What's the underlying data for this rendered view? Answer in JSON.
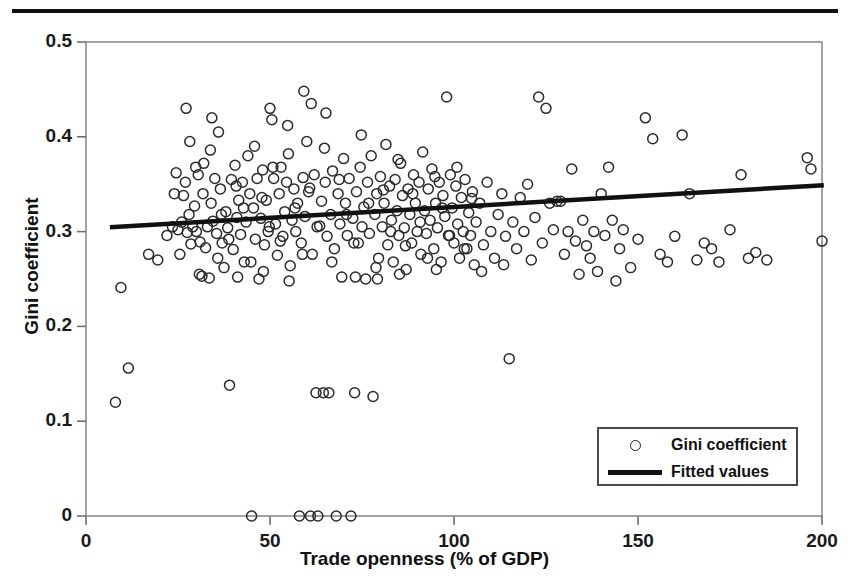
{
  "figure": {
    "has_top_rule": true,
    "background_color": "#ffffff",
    "ink_color": "#111111",
    "axis_color": "#808080"
  },
  "legend": {
    "position": "bottom-right",
    "entries": [
      {
        "label": "Gini coefficient",
        "marker": "open-circle"
      },
      {
        "label": "Fitted values",
        "marker": "solid-line"
      }
    ]
  },
  "chart_data": {
    "type": "scatter",
    "title": "",
    "xlabel": "Trade openness (% of GDP)",
    "ylabel": "Gini coefficient",
    "xlim": [
      0,
      200
    ],
    "ylim": [
      0,
      0.5
    ],
    "xticks": [
      0,
      50,
      100,
      150,
      200
    ],
    "xtick_labels": [
      "0",
      "50",
      "100",
      "150",
      "200"
    ],
    "yticks": [
      0,
      0.1,
      0.2,
      0.3,
      0.4,
      0.5
    ],
    "ytick_labels": [
      "0",
      "0.1",
      "0.2",
      "0.3",
      "0.4",
      "0.5"
    ],
    "grid": false,
    "legend_position": "lower right",
    "series": [
      {
        "name": "Gini coefficient",
        "marker": "open-circle",
        "marker_size": 10,
        "points": [
          [
            9.5,
            0.241
          ],
          [
            8.0,
            0.12
          ],
          [
            11.5,
            0.156
          ],
          [
            39.0,
            0.138
          ],
          [
            17.0,
            0.276
          ],
          [
            19.5,
            0.27
          ],
          [
            22.0,
            0.296
          ],
          [
            23.5,
            0.305
          ],
          [
            25.0,
            0.302
          ],
          [
            26.0,
            0.31
          ],
          [
            26.5,
            0.338
          ],
          [
            27.0,
            0.352
          ],
          [
            27.5,
            0.299
          ],
          [
            28.0,
            0.318
          ],
          [
            28.5,
            0.287
          ],
          [
            29.0,
            0.305
          ],
          [
            29.5,
            0.327
          ],
          [
            30.0,
            0.3
          ],
          [
            30.5,
            0.36
          ],
          [
            31.0,
            0.289
          ],
          [
            31.5,
            0.253
          ],
          [
            32.0,
            0.372
          ],
          [
            32.5,
            0.283
          ],
          [
            33.0,
            0.305
          ],
          [
            33.5,
            0.251
          ],
          [
            34.0,
            0.33
          ],
          [
            34.5,
            0.311
          ],
          [
            35.0,
            0.356
          ],
          [
            35.5,
            0.298
          ],
          [
            36.0,
            0.405
          ],
          [
            36.5,
            0.345
          ],
          [
            37.0,
            0.288
          ],
          [
            37.5,
            0.262
          ],
          [
            38.0,
            0.321
          ],
          [
            38.5,
            0.304
          ],
          [
            39.5,
            0.355
          ],
          [
            40.0,
            0.281
          ],
          [
            40.5,
            0.37
          ],
          [
            41.0,
            0.315
          ],
          [
            41.5,
            0.333
          ],
          [
            42.0,
            0.297
          ],
          [
            42.5,
            0.352
          ],
          [
            43.0,
            0.268
          ],
          [
            43.5,
            0.31
          ],
          [
            44.0,
            0.38
          ],
          [
            44.5,
            0.34
          ],
          [
            45.0,
            0.0
          ],
          [
            45.5,
            0.325
          ],
          [
            46.0,
            0.292
          ],
          [
            46.5,
            0.356
          ],
          [
            47.0,
            0.25
          ],
          [
            47.5,
            0.314
          ],
          [
            48.0,
            0.365
          ],
          [
            48.5,
            0.286
          ],
          [
            49.0,
            0.333
          ],
          [
            49.5,
            0.3
          ],
          [
            50.0,
            0.43
          ],
          [
            50.5,
            0.418
          ],
          [
            51.0,
            0.356
          ],
          [
            51.5,
            0.308
          ],
          [
            52.0,
            0.275
          ],
          [
            52.5,
            0.34
          ],
          [
            53.0,
            0.368
          ],
          [
            53.5,
            0.295
          ],
          [
            54.0,
            0.321
          ],
          [
            54.5,
            0.352
          ],
          [
            55.0,
            0.382
          ],
          [
            55.5,
            0.264
          ],
          [
            56.0,
            0.312
          ],
          [
            56.5,
            0.345
          ],
          [
            57.0,
            0.3
          ],
          [
            57.5,
            0.33
          ],
          [
            58.0,
            0.0
          ],
          [
            58.5,
            0.288
          ],
          [
            59.0,
            0.357
          ],
          [
            59.5,
            0.316
          ],
          [
            60.0,
            0.395
          ],
          [
            60.5,
            0.342
          ],
          [
            61.0,
            0.0
          ],
          [
            61.5,
            0.276
          ],
          [
            62.0,
            0.36
          ],
          [
            62.5,
            0.13
          ],
          [
            63.0,
            0.0
          ],
          [
            63.5,
            0.306
          ],
          [
            64.0,
            0.332
          ],
          [
            64.5,
            0.13
          ],
          [
            65.0,
            0.352
          ],
          [
            65.5,
            0.295
          ],
          [
            66.0,
            0.13
          ],
          [
            66.5,
            0.318
          ],
          [
            67.0,
            0.364
          ],
          [
            67.5,
            0.282
          ],
          [
            68.0,
            0.0
          ],
          [
            68.5,
            0.34
          ],
          [
            69.0,
            0.308
          ],
          [
            69.5,
            0.252
          ],
          [
            70.0,
            0.377
          ],
          [
            70.5,
            0.33
          ],
          [
            71.0,
            0.296
          ],
          [
            71.5,
            0.356
          ],
          [
            72.0,
            0.0
          ],
          [
            72.5,
            0.314
          ],
          [
            73.0,
            0.13
          ],
          [
            73.5,
            0.342
          ],
          [
            74.0,
            0.288
          ],
          [
            74.5,
            0.368
          ],
          [
            75.0,
            0.305
          ],
          [
            75.5,
            0.326
          ],
          [
            76.0,
            0.25
          ],
          [
            76.5,
            0.352
          ],
          [
            77.0,
            0.298
          ],
          [
            77.5,
            0.38
          ],
          [
            78.0,
            0.126
          ],
          [
            78.5,
            0.318
          ],
          [
            79.0,
            0.34
          ],
          [
            79.5,
            0.272
          ],
          [
            80.0,
            0.358
          ],
          [
            80.5,
            0.305
          ],
          [
            81.0,
            0.33
          ],
          [
            81.5,
            0.392
          ],
          [
            82.0,
            0.286
          ],
          [
            82.5,
            0.348
          ],
          [
            83.0,
            0.312
          ],
          [
            83.5,
            0.268
          ],
          [
            84.0,
            0.355
          ],
          [
            84.5,
            0.322
          ],
          [
            85.0,
            0.296
          ],
          [
            85.5,
            0.372
          ],
          [
            86.0,
            0.338
          ],
          [
            86.5,
            0.304
          ],
          [
            87.0,
            0.26
          ],
          [
            87.5,
            0.345
          ],
          [
            88.0,
            0.318
          ],
          [
            88.5,
            0.288
          ],
          [
            89.0,
            0.36
          ],
          [
            89.5,
            0.33
          ],
          [
            90.0,
            0.3
          ],
          [
            90.5,
            0.352
          ],
          [
            91.0,
            0.276
          ],
          [
            91.5,
            0.384
          ],
          [
            92.0,
            0.322
          ],
          [
            92.5,
            0.298
          ],
          [
            93.0,
            0.345
          ],
          [
            93.5,
            0.312
          ],
          [
            94.0,
            0.366
          ],
          [
            94.5,
            0.282
          ],
          [
            95.0,
            0.33
          ],
          [
            95.5,
            0.304
          ],
          [
            96.0,
            0.352
          ],
          [
            96.5,
            0.268
          ],
          [
            97.0,
            0.338
          ],
          [
            97.5,
            0.316
          ],
          [
            98.0,
            0.442
          ],
          [
            98.5,
            0.296
          ],
          [
            99.0,
            0.36
          ],
          [
            99.5,
            0.325
          ],
          [
            100.0,
            0.288
          ],
          [
            100.5,
            0.348
          ],
          [
            101.0,
            0.308
          ],
          [
            101.5,
            0.272
          ],
          [
            102.0,
            0.336
          ],
          [
            102.5,
            0.3
          ],
          [
            103.0,
            0.355
          ],
          [
            103.5,
            0.282
          ],
          [
            104.0,
            0.32
          ],
          [
            104.5,
            0.296
          ],
          [
            105.0,
            0.342
          ],
          [
            105.5,
            0.265
          ],
          [
            106.0,
            0.31
          ],
          [
            107.0,
            0.33
          ],
          [
            108.0,
            0.286
          ],
          [
            109.0,
            0.352
          ],
          [
            110.0,
            0.3
          ],
          [
            111.0,
            0.272
          ],
          [
            112.0,
            0.318
          ],
          [
            113.0,
            0.34
          ],
          [
            114.0,
            0.295
          ],
          [
            115.0,
            0.166
          ],
          [
            116.0,
            0.31
          ],
          [
            117.0,
            0.282
          ],
          [
            118.0,
            0.336
          ],
          [
            119.0,
            0.3
          ],
          [
            120.0,
            0.35
          ],
          [
            121.0,
            0.27
          ],
          [
            122.0,
            0.315
          ],
          [
            123.0,
            0.442
          ],
          [
            124.0,
            0.288
          ],
          [
            125.0,
            0.43
          ],
          [
            126.0,
            0.33
          ],
          [
            127.0,
            0.302
          ],
          [
            128.0,
            0.332
          ],
          [
            129.0,
            0.332
          ],
          [
            130.0,
            0.276
          ],
          [
            131.0,
            0.3
          ],
          [
            132.0,
            0.366
          ],
          [
            133.0,
            0.29
          ],
          [
            134.0,
            0.255
          ],
          [
            135.0,
            0.312
          ],
          [
            136.0,
            0.285
          ],
          [
            137.0,
            0.272
          ],
          [
            138.0,
            0.3
          ],
          [
            139.0,
            0.258
          ],
          [
            140.0,
            0.34
          ],
          [
            141.0,
            0.296
          ],
          [
            142.0,
            0.368
          ],
          [
            143.0,
            0.312
          ],
          [
            144.0,
            0.248
          ],
          [
            145.0,
            0.282
          ],
          [
            146.0,
            0.302
          ],
          [
            148.0,
            0.262
          ],
          [
            150.0,
            0.292
          ],
          [
            152.0,
            0.42
          ],
          [
            154.0,
            0.398
          ],
          [
            156.0,
            0.276
          ],
          [
            158.0,
            0.268
          ],
          [
            160.0,
            0.295
          ],
          [
            162.0,
            0.402
          ],
          [
            164.0,
            0.34
          ],
          [
            166.0,
            0.27
          ],
          [
            168.0,
            0.288
          ],
          [
            170.0,
            0.282
          ],
          [
            172.0,
            0.268
          ],
          [
            175.0,
            0.302
          ],
          [
            178.0,
            0.36
          ],
          [
            180.0,
            0.272
          ],
          [
            182.0,
            0.278
          ],
          [
            185.0,
            0.27
          ],
          [
            196.0,
            0.378
          ],
          [
            197.0,
            0.366
          ],
          [
            200.0,
            0.29
          ],
          [
            24.0,
            0.34
          ],
          [
            24.5,
            0.362
          ],
          [
            25.5,
            0.276
          ],
          [
            28.2,
            0.395
          ],
          [
            29.8,
            0.368
          ],
          [
            30.8,
            0.255
          ],
          [
            31.8,
            0.34
          ],
          [
            33.8,
            0.386
          ],
          [
            35.8,
            0.272
          ],
          [
            36.8,
            0.318
          ],
          [
            38.8,
            0.292
          ],
          [
            40.8,
            0.348
          ],
          [
            42.8,
            0.325
          ],
          [
            44.8,
            0.268
          ],
          [
            45.8,
            0.39
          ],
          [
            47.8,
            0.336
          ],
          [
            49.8,
            0.305
          ],
          [
            50.8,
            0.368
          ],
          [
            52.8,
            0.29
          ],
          [
            54.8,
            0.412
          ],
          [
            56.8,
            0.325
          ],
          [
            58.8,
            0.276
          ],
          [
            60.8,
            0.346
          ],
          [
            62.8,
            0.305
          ],
          [
            64.8,
            0.388
          ],
          [
            66.8,
            0.268
          ],
          [
            68.8,
            0.355
          ],
          [
            70.8,
            0.318
          ],
          [
            72.8,
            0.288
          ],
          [
            74.8,
            0.402
          ],
          [
            76.8,
            0.33
          ],
          [
            78.8,
            0.262
          ],
          [
            80.8,
            0.344
          ],
          [
            82.8,
            0.3
          ],
          [
            84.8,
            0.376
          ],
          [
            86.8,
            0.285
          ],
          [
            88.8,
            0.34
          ],
          [
            90.8,
            0.31
          ],
          [
            92.8,
            0.272
          ],
          [
            94.8,
            0.358
          ],
          [
            96.8,
            0.325
          ],
          [
            98.8,
            0.296
          ],
          [
            100.8,
            0.368
          ],
          [
            102.8,
            0.282
          ],
          [
            104.8,
            0.335
          ],
          [
            27.2,
            0.43
          ],
          [
            34.2,
            0.42
          ],
          [
            41.2,
            0.252
          ],
          [
            48.2,
            0.258
          ],
          [
            55.2,
            0.248
          ],
          [
            59.2,
            0.448
          ],
          [
            61.2,
            0.435
          ],
          [
            65.2,
            0.425
          ],
          [
            73.2,
            0.252
          ],
          [
            79.2,
            0.25
          ],
          [
            85.2,
            0.255
          ],
          [
            95.2,
            0.26
          ],
          [
            107.5,
            0.258
          ],
          [
            113.5,
            0.265
          ]
        ]
      }
    ],
    "fit_line": {
      "name": "Fitted values",
      "x_start": 6.5,
      "y_start": 0.3045,
      "x_end": 200.5,
      "y_end": 0.349,
      "slope": 0.000229,
      "intercept": 0.303
    }
  }
}
